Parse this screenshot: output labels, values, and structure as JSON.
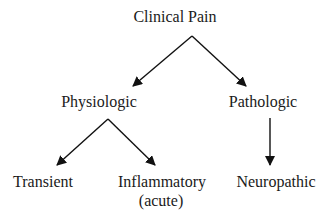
{
  "diagram": {
    "type": "tree",
    "root": {
      "label": "Clinical Pain"
    },
    "level1": [
      {
        "label": "Physiologic"
      },
      {
        "label": "Pathologic"
      }
    ],
    "level2": [
      {
        "label": "Transient",
        "parent": "Physiologic"
      },
      {
        "label": "Inflammatory",
        "sublabel": "(acute)",
        "parent": "Physiologic"
      },
      {
        "label": "Neuropathic",
        "parent": "Pathologic"
      }
    ],
    "edges": [
      {
        "from": "Clinical Pain",
        "to": "Physiologic"
      },
      {
        "from": "Clinical Pain",
        "to": "Pathologic"
      },
      {
        "from": "Physiologic",
        "to": "Transient"
      },
      {
        "from": "Physiologic",
        "to": "Inflammatory"
      },
      {
        "from": "Pathologic",
        "to": "Neuropathic"
      }
    ],
    "colors": {
      "text": "#1a1a1a",
      "arrow": "#111111",
      "background": "#ffffff"
    }
  }
}
